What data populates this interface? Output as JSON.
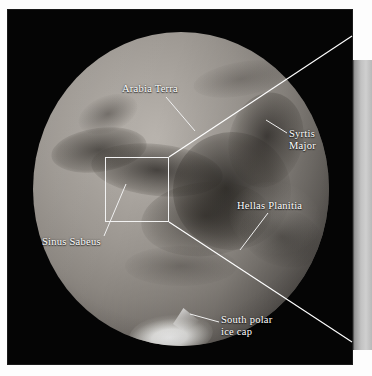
{
  "figure": {
    "type": "telescopic-disk-photograph",
    "caption_labels_count": 5
  },
  "labels": {
    "arabia_terra": "Arabia Terra",
    "syrtis_major_line1": "Syrtis",
    "syrtis_major_line2": "Major",
    "hellas_planitia": "Hellas Planitia",
    "sinus_sabeus": "Sinus Sabeus",
    "south_polar_line1": "South polar",
    "south_polar_line2": "ice cap"
  },
  "colors": {
    "frame_background": "#050505",
    "label_text": "#ffffff",
    "leader_line": "#ffffff",
    "zoom_box_border": "#f2f2f2",
    "inset_panel": "#c2c2c2",
    "page_background": "#ffffff",
    "ice_cap": "#ffffff",
    "disk_highlight": "#b9b4ae",
    "disk_shadow": "#37342f"
  },
  "geometry": {
    "frame": {
      "x": 8,
      "y": 10,
      "width": 344,
      "height": 354
    },
    "disk": {
      "center_x": 173,
      "center_y": 179,
      "radius_x": 148,
      "radius_y": 157
    },
    "zoom_box": {
      "x": 105,
      "y": 157,
      "width": 64,
      "height": 65
    },
    "inset_panel": {
      "x": 352,
      "y": 60,
      "width": 20,
      "height": 290
    }
  },
  "features": [
    {
      "name": "Arabia Terra",
      "kind": "bright-highland",
      "region": "north-central"
    },
    {
      "name": "Syrtis Major",
      "kind": "dark-albedo-feature",
      "region": "north-east-limb"
    },
    {
      "name": "Hellas Planitia",
      "kind": "impact-basin",
      "region": "south-east"
    },
    {
      "name": "Sinus Sabeus",
      "kind": "dark-albedo-feature",
      "region": "center-west"
    },
    {
      "name": "South polar ice cap",
      "kind": "polar-cap",
      "region": "south-limb"
    }
  ]
}
